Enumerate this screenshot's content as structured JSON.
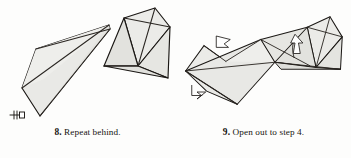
{
  "page": {
    "background_color": "#fdfdfc",
    "ink_color": "#16130f",
    "panel_count": 2
  },
  "style": {
    "paper_fill": "#e9e9e6",
    "paper_fill_dark": "#dededa",
    "paper_fill_light": "#f1f1ee",
    "outline_color": "#1a1714",
    "crease_color": "#2a2622",
    "arrow_fill": "#ffffff",
    "arrow_stroke": "#1a1714"
  },
  "figures": [
    {
      "id": "figure-step-8",
      "caption": {
        "number": "8.",
        "text": "Repeat behind."
      },
      "markers": [
        {
          "name": "repeat-behind-symbol",
          "kind": "repeat-tick",
          "description": "double-tick repeat-behind mark at left tip",
          "x": 17,
          "y": 117
        }
      ],
      "shapes": [
        {
          "name": "left-wing-panel",
          "fill": "#e9e9e6",
          "points": "22,88 36,49 109,25 110,29 40,116"
        },
        {
          "name": "left-wing-upper-flap",
          "fill": "#eeeeeb",
          "points": "22,88 36,49 109,25 44,79"
        },
        {
          "name": "center-lower-triangle",
          "fill": "#e4e4e0",
          "points": "109,25 110,29 40,116"
        },
        {
          "name": "right-head-panel",
          "fill": "#ebebe8",
          "points": "124,18 155,8 170,27 138,66"
        },
        {
          "name": "right-head-lower-triangle",
          "fill": "#e2e2de",
          "points": "124,18 138,66 104,66"
        },
        {
          "name": "right-tail-triangle",
          "fill": "#e6e6e2",
          "points": "138,66 170,27 168,78"
        },
        {
          "name": "right-tail-bottom",
          "fill": "#e1e1dd",
          "points": "138,66 168,78 104,66"
        }
      ],
      "creases": [
        {
          "name": "crease-wing-fold",
          "from": "22,88",
          "to": "109,25"
        },
        {
          "name": "crease-wing-spine",
          "from": "36,49",
          "to": "110,29"
        },
        {
          "name": "crease-head-diag",
          "from": "124,18",
          "to": "170,27"
        },
        {
          "name": "crease-head-spine",
          "from": "155,8",
          "to": "138,66"
        },
        {
          "name": "crease-neck",
          "from": "138,66",
          "to": "104,66"
        }
      ]
    },
    {
      "id": "figure-step-9",
      "caption": {
        "number": "9.",
        "text": "Open out to step 4."
      },
      "markers": [
        {
          "name": "open-out-arrow-upper",
          "kind": "hollow-arrow",
          "direction": "up-left",
          "x": 54,
          "y": 39
        },
        {
          "name": "open-out-arrow-right",
          "kind": "hollow-arrow-curved",
          "direction": "up",
          "x": 139,
          "y": 42
        },
        {
          "name": "open-out-arrow-lower-left",
          "kind": "hollow-arrow-curved",
          "direction": "down-left",
          "x": 22,
          "y": 96
        }
      ],
      "shapes": [
        {
          "name": "far-left-small-flap",
          "fill": "#ebebe8",
          "points": "11,72 32,43 57,61"
        },
        {
          "name": "left-wing-panel",
          "fill": "#e9e9e6",
          "points": "11,72 57,61 70,110 35,95"
        },
        {
          "name": "main-body-panel",
          "fill": "#e8e8e5",
          "points": "11,72 97,36 113,62 70,110"
        },
        {
          "name": "mid-upper-panel",
          "fill": "#eeeeeb",
          "points": "57,61 97,36 113,62"
        },
        {
          "name": "center-right-panel",
          "fill": "#e6e6e2",
          "points": "97,36 150,22 153,66 113,62"
        },
        {
          "name": "right-head-panel",
          "fill": "#ebebe8",
          "points": "150,22 176,10 190,33 160,68"
        },
        {
          "name": "right-head-lower",
          "fill": "#e2e2de",
          "points": "150,22 160,68 113,62"
        },
        {
          "name": "right-tail-triangle",
          "fill": "#e4e4e0",
          "points": "160,68 190,33 188,70"
        },
        {
          "name": "baseline-strip",
          "fill": "#dededa",
          "points": "113,62 160,68 188,70 120,70"
        }
      ],
      "creases": [
        {
          "name": "crease-body-long",
          "from": "11,72",
          "to": "113,62"
        },
        {
          "name": "crease-wing-left",
          "from": "11,72",
          "to": "70,110"
        },
        {
          "name": "crease-mid-spine",
          "from": "57,61",
          "to": "97,36"
        },
        {
          "name": "crease-center-diag",
          "from": "97,36",
          "to": "153,66"
        },
        {
          "name": "crease-head-diag",
          "from": "150,22",
          "to": "190,33"
        },
        {
          "name": "crease-head-spine",
          "from": "176,10",
          "to": "160,68"
        },
        {
          "name": "crease-base-line",
          "from": "113,62",
          "to": "188,70"
        }
      ]
    }
  ]
}
